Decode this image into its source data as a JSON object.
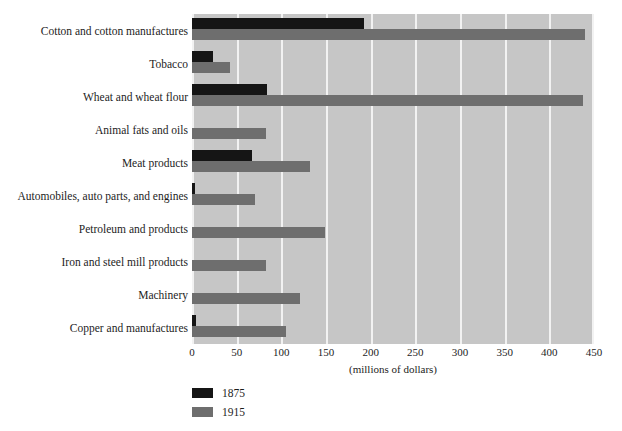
{
  "chart_data": {
    "type": "bar",
    "orientation": "horizontal",
    "title": "",
    "xlabel": "(millions of dollars)",
    "ylabel": "",
    "xlim": [
      0,
      450
    ],
    "xticks": [
      0,
      50,
      100,
      150,
      200,
      250,
      300,
      350,
      400,
      450
    ],
    "grid": true,
    "legend_position": "below-left",
    "categories": [
      "Cotton and cotton manufactures",
      "Tobacco",
      "Wheat and wheat flour",
      "Animal fats and oils",
      "Meat products",
      "Automobiles, auto parts, and engines",
      "Petroleum and products",
      "Iron and steel mill products",
      "Machinery",
      "Copper and manufactures"
    ],
    "series": [
      {
        "name": "1875",
        "color": "#151515",
        "values": [
          192,
          23,
          84,
          0,
          67,
          3,
          0,
          0,
          0,
          4
        ]
      },
      {
        "name": "1915",
        "color": "#6e6e6e",
        "values": [
          440,
          43,
          438,
          83,
          132,
          70,
          149,
          83,
          121,
          105
        ]
      }
    ]
  },
  "plot": {
    "background_color": "#c6c6c6",
    "gridline_color": "#f2f2f2"
  },
  "legend": {
    "entries": [
      {
        "label": "1875",
        "color": "#151515"
      },
      {
        "label": "1915",
        "color": "#6e6e6e"
      }
    ]
  }
}
